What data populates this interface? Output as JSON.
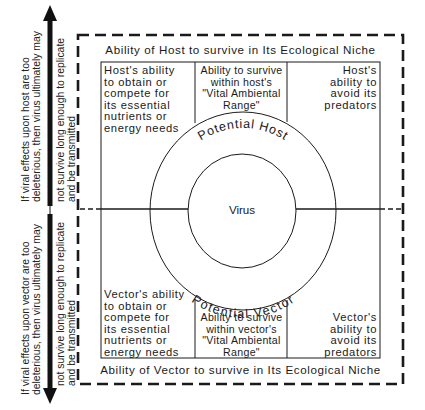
{
  "diagram": {
    "host_niche_title": "Ability of Host to survive in Its Ecological Niche",
    "vector_niche_title": "Ability of Vector to survive in Its Ecological Niche",
    "host_cells": {
      "left": [
        "Host's ability",
        "to obtain or",
        "compete for",
        "its essential",
        "nutrients or",
        "energy needs"
      ],
      "middle": [
        "Ability to survive",
        "within host's",
        "\"Vital Ambiental",
        "Range\""
      ],
      "right": [
        "Host's",
        "ability to",
        "avoid its",
        "predators"
      ]
    },
    "vector_cells": {
      "left": [
        "Vector's ability",
        "to obtain or",
        "compete for",
        "its essential",
        "nutrients or",
        "energy needs"
      ],
      "middle": [
        "Ability to survive",
        "within vector's",
        "\"Vital Ambiental",
        "Range\""
      ],
      "right": [
        "Vector's",
        "ability to",
        "avoid its",
        "predators"
      ]
    },
    "outer_ring_top_label": "Potential Host",
    "outer_ring_bottom_label": "Potential Vector",
    "center_label": "Virus",
    "side_notes": {
      "host": {
        "line1": "If viral effects upon host are too",
        "line2": "deleterious, then virus ultimately may",
        "line3": "not survive long enough to replicate",
        "line4": "and be transmitted"
      },
      "vector": {
        "line1": "If viral effects upon vector are too",
        "line2": "deleterious, then virus ultimately may",
        "line3": "not survive long enough to replicate",
        "line4": "and be transmitted"
      }
    },
    "arrows": {
      "up": "arrow-up-icon",
      "down": "arrow-down-icon"
    },
    "colors": {
      "ink": "#1a1a1a",
      "background": "#ffffff"
    }
  }
}
